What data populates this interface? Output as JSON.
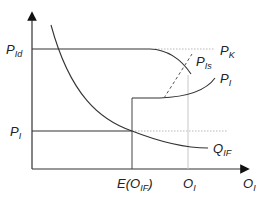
{
  "diagram": {
    "type": "economics-curve-diagram",
    "axes": {
      "x_label": {
        "main": "O",
        "sub": "I"
      },
      "y_label": null
    },
    "y_ticks": [
      {
        "id": "p_id",
        "main": "P",
        "sub": "Id"
      },
      {
        "id": "p_i",
        "main": "P",
        "sub": "I"
      }
    ],
    "x_ticks": [
      {
        "id": "e_oif",
        "text_pre": "E(O",
        "sub": "IF",
        "text_post": ")"
      },
      {
        "id": "o_i",
        "main": "O",
        "sub": "I"
      }
    ],
    "curve_labels": [
      {
        "id": "p_k",
        "main": "P",
        "sub": "K"
      },
      {
        "id": "p_is",
        "main": "P",
        "sub": "Is"
      },
      {
        "id": "p_i_curve",
        "main": "P",
        "sub": "I"
      },
      {
        "id": "q_if",
        "main": "Q",
        "sub": "IF"
      }
    ],
    "colors": {
      "line": "#333333",
      "dotted": "#b0b0b0",
      "dashed": "#555555"
    }
  }
}
